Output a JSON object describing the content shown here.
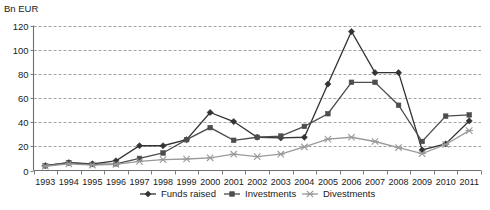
{
  "chart_data": {
    "type": "line",
    "title": "",
    "subtitle": "",
    "xlabel": "",
    "ylabel": "Bn EUR",
    "unit_label": "Bn EUR",
    "grid": true,
    "legend_position": "bottom",
    "ylim": [
      0,
      120
    ],
    "ytick_labels": [
      "0",
      "20",
      "40",
      "60",
      "80",
      "100",
      "120"
    ],
    "yticks": [
      0,
      20,
      40,
      60,
      80,
      100,
      120
    ],
    "categories": [
      "1993",
      "1994",
      "1995",
      "1996",
      "1997",
      "1998",
      "1999",
      "2000",
      "2001",
      "2002",
      "2003",
      "2004",
      "2005",
      "2006",
      "2007",
      "2008",
      "2009",
      "2010",
      "2011"
    ],
    "x": [
      1993,
      1994,
      1995,
      1996,
      1997,
      1998,
      1999,
      2000,
      2001,
      2002,
      2003,
      2004,
      2005,
      2006,
      2007,
      2008,
      2009,
      2010,
      2011
    ],
    "series": [
      {
        "name": "Funds raised",
        "marker": "diamond",
        "color": "#333333",
        "values": [
          4,
          6.5,
          5.5,
          8,
          20.5,
          20.5,
          25.5,
          48,
          40.5,
          27.5,
          27,
          27.5,
          71.5,
          115,
          81,
          81,
          17,
          22,
          41
        ]
      },
      {
        "name": "Investments",
        "marker": "square",
        "color": "#4d4d4d",
        "values": [
          4,
          6.5,
          5,
          5.5,
          10,
          14.5,
          25.5,
          35.5,
          25,
          27.5,
          28.5,
          36.5,
          47,
          73,
          73,
          54,
          24,
          45,
          46
        ]
      },
      {
        "name": "Divestments",
        "marker": "x",
        "color": "#9a9a9a",
        "values": [
          3.5,
          5.5,
          4.5,
          5,
          7.5,
          9,
          9.5,
          10.5,
          13.5,
          11.5,
          13.5,
          19.5,
          26,
          27.5,
          24,
          19,
          14,
          21.5,
          33
        ]
      }
    ],
    "legend": [
      {
        "label": "Funds raised",
        "marker": "diamond",
        "color": "#333333"
      },
      {
        "label": "Investments",
        "marker": "square",
        "color": "#4d4d4d"
      },
      {
        "label": "Divestments",
        "marker": "x",
        "color": "#9a9a9a"
      }
    ]
  }
}
